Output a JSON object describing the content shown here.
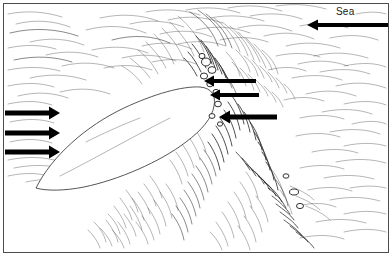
{
  "figure": {
    "background_color": "#ffffff",
    "ink_color": "#2b2b2b",
    "frame": {
      "name": "figure-border",
      "color": "#4c4c4c",
      "x": 3,
      "y": 3,
      "width": 386,
      "height": 250
    }
  },
  "labels": {
    "sea": "Sea"
  },
  "landform": {
    "name": "spit-landform",
    "description": "White leaf-shaped sand spit",
    "fill": "#ffffff",
    "outline": "#2b2b2b"
  },
  "arrows": {
    "color": "#000000",
    "longshore_drift": [
      {
        "name": "drift-arrow-top",
        "direction": "right",
        "x1": 5,
        "y1": 113,
        "x2": 58,
        "y2": 113,
        "thickness": 5
      },
      {
        "name": "drift-arrow-middle",
        "direction": "right",
        "x1": 5,
        "y1": 133,
        "x2": 58,
        "y2": 133,
        "thickness": 5
      },
      {
        "name": "drift-arrow-bottom",
        "direction": "right",
        "x1": 5,
        "y1": 152,
        "x2": 58,
        "y2": 152,
        "thickness": 5
      }
    ],
    "wave_approach": [
      {
        "name": "wave-arrow-top",
        "direction": "left",
        "x1": 256,
        "y1": 81,
        "x2": 206,
        "y2": 81,
        "thickness": 4
      },
      {
        "name": "wave-arrow-middle",
        "direction": "left",
        "x1": 259,
        "y1": 95,
        "x2": 213,
        "y2": 95,
        "thickness": 4
      },
      {
        "name": "wave-arrow-bottom",
        "direction": "left",
        "x1": 277,
        "y1": 117,
        "x2": 222,
        "y2": 117,
        "thickness": 5
      }
    ],
    "sea_arrow": {
      "name": "sea-direction-arrow",
      "direction": "left",
      "x1": 388,
      "y1": 25,
      "x2": 308,
      "y2": 25,
      "thickness": 4
    }
  },
  "sea_label_position": {
    "x": 336,
    "y": 6
  },
  "texture": {
    "description": "Hand-drawn pen hatching representing wave crests and surf",
    "upper_field_seed": 11,
    "lower_field_seed": 29,
    "surf_zone_seed": 47
  }
}
